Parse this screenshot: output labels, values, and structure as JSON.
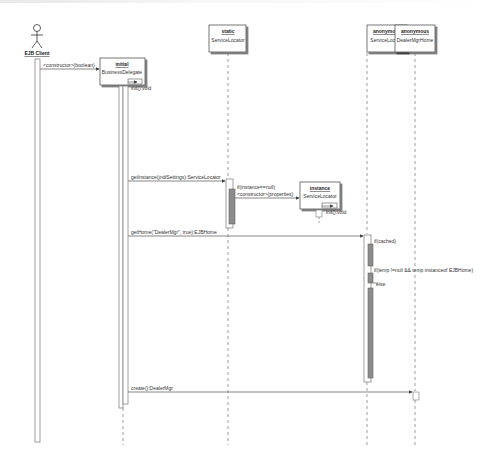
{
  "diagram": {
    "type": "uml-sequence",
    "actor": {
      "name": "EJB Client"
    },
    "lifelines": [
      {
        "id": "bd",
        "stereotype": "initial",
        "name": "BusinessDelegate"
      },
      {
        "id": "sl",
        "stereotype": "static",
        "name": "ServiceLocator"
      },
      {
        "id": "sl2",
        "stereotype": "instance",
        "name": "ServiceLocator"
      },
      {
        "id": "asl",
        "stereotype": "anonymous",
        "name": "ServiceLocator"
      },
      {
        "id": "home",
        "stereotype": "anonymous",
        "name": "DealerMgrHome"
      }
    ],
    "messages": [
      {
        "from": "EJB Client",
        "to": "BusinessDelegate",
        "label": "<constructor>(boolean)"
      },
      {
        "from": "BusinessDelegate",
        "to": "BusinessDelegate",
        "label": "init():void"
      },
      {
        "from": "BusinessDelegate",
        "to": "static ServiceLocator",
        "label": "getInstance(jndiSettings):ServiceLocator"
      },
      {
        "from": "static ServiceLocator",
        "to": "instance ServiceLocator",
        "label": "<constructor>(properties)",
        "guard": "if(instance==null)"
      },
      {
        "from": "instance ServiceLocator",
        "to": "instance ServiceLocator",
        "label": "init():void"
      },
      {
        "from": "BusinessDelegate",
        "to": "anonymous ServiceLocator",
        "label": "getHome(\"DealerMgr\", true):EJBHome"
      },
      {
        "from": "anonymous ServiceLocator",
        "to": "anonymous ServiceLocator",
        "label": "if(cached)"
      },
      {
        "from": "anonymous ServiceLocator",
        "to": "anonymous ServiceLocator",
        "label": "if(temp !=null && temp instanceof EJBHome)"
      },
      {
        "from": "anonymous ServiceLocator",
        "to": "anonymous ServiceLocator",
        "label": "else"
      },
      {
        "from": "BusinessDelegate",
        "to": "DealerMgrHome",
        "label": "create():DealerMgr"
      }
    ]
  },
  "labels": {
    "actor": "EJB Client",
    "bd_stereo": "initial",
    "bd_name": "BusinessDelegate",
    "sl_stereo": "static",
    "sl_name": "ServiceLocator",
    "sl2_stereo": "instance",
    "sl2_name": "ServiceLocator",
    "asl_stereo": "anonymous",
    "asl_name": "ServiceLocator",
    "home_stereo": "anonymous",
    "home_name": "DealerMgrHome",
    "m_ctor_bool": "<constructor>(boolean)",
    "m_init1": "init():void",
    "m_getinstance": "getInstance(jndiSettings):ServiceLocator",
    "m_guard_null": "if(instance==null)",
    "m_ctor_props": "<constructor>(properties)",
    "m_init2": "init():void",
    "m_gethome": "getHome(\"DealerMgr\", true):EJBHome",
    "m_cached": "if(cached)",
    "m_temp": "if(temp !=null && temp instanceof EJBHome)",
    "m_else": "else",
    "m_create": "create():DealerMgr"
  },
  "colors": {
    "line": "#7a7a7a",
    "activation_fill": "#8c8c8c",
    "box_border": "#555555"
  }
}
